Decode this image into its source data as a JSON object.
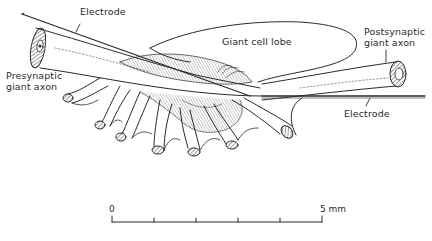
{
  "figure": {
    "labels": {
      "electrode_top": "Electrode",
      "presynaptic_line1": "Presynaptic",
      "presynaptic_line2": "giant axon",
      "giant_cell_lobe": "Giant cell lobe",
      "postsynaptic_line1": "Postsynaptic",
      "postsynaptic_line2": "giant axon",
      "electrode_bottom": "Electrode"
    },
    "scale_bar": {
      "start_label": "0",
      "end_label": "5 mm",
      "ticks": 6
    },
    "colors": {
      "ink": "#2a2a2a",
      "background": "#ffffff"
    }
  }
}
